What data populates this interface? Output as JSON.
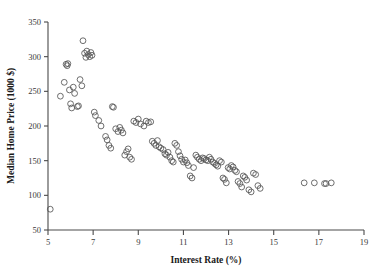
{
  "chart_data": {
    "type": "scatter",
    "title": "",
    "xlabel": "Interest Rate (%)",
    "ylabel": "Median Home Price (1000 $)",
    "xlim": [
      5,
      19
    ],
    "ylim": [
      50,
      350
    ],
    "xticks": [
      5,
      7,
      9,
      11,
      13,
      15,
      17,
      19
    ],
    "yticks": [
      50,
      100,
      150,
      200,
      250,
      300,
      350
    ],
    "xtick_labels": [
      "5",
      "7",
      "9",
      "11",
      "13",
      "15",
      "17",
      "19"
    ],
    "ytick_labels": [
      "50",
      "100",
      "150",
      "200",
      "250",
      "300",
      "350"
    ],
    "grid": false,
    "legend": false,
    "marker": "open-circle",
    "marker_color": "#555555",
    "points": [
      [
        5.1,
        80
      ],
      [
        5.55,
        243
      ],
      [
        5.72,
        263
      ],
      [
        5.8,
        289
      ],
      [
        5.85,
        287
      ],
      [
        5.88,
        290
      ],
      [
        5.95,
        252
      ],
      [
        6.0,
        232
      ],
      [
        6.05,
        226
      ],
      [
        6.12,
        256
      ],
      [
        6.18,
        247
      ],
      [
        6.3,
        228
      ],
      [
        6.35,
        229
      ],
      [
        6.42,
        267
      ],
      [
        6.5,
        258
      ],
      [
        6.55,
        323
      ],
      [
        6.62,
        305
      ],
      [
        6.68,
        299
      ],
      [
        6.72,
        308
      ],
      [
        6.78,
        303
      ],
      [
        6.85,
        300
      ],
      [
        6.9,
        306
      ],
      [
        6.95,
        302
      ],
      [
        7.05,
        220
      ],
      [
        7.1,
        215
      ],
      [
        7.25,
        208
      ],
      [
        7.35,
        200
      ],
      [
        7.55,
        185
      ],
      [
        7.62,
        180
      ],
      [
        7.7,
        172
      ],
      [
        7.78,
        168
      ],
      [
        7.85,
        228
      ],
      [
        7.9,
        227
      ],
      [
        8.0,
        196
      ],
      [
        8.1,
        192
      ],
      [
        8.18,
        198
      ],
      [
        8.25,
        194
      ],
      [
        8.32,
        190
      ],
      [
        8.4,
        158
      ],
      [
        8.48,
        163
      ],
      [
        8.55,
        167
      ],
      [
        8.62,
        155
      ],
      [
        8.7,
        152
      ],
      [
        8.8,
        207
      ],
      [
        8.9,
        205
      ],
      [
        9.0,
        210
      ],
      [
        9.1,
        203
      ],
      [
        9.25,
        200
      ],
      [
        9.35,
        207
      ],
      [
        9.45,
        205
      ],
      [
        9.55,
        206
      ],
      [
        9.62,
        178
      ],
      [
        9.7,
        175
      ],
      [
        9.78,
        172
      ],
      [
        9.85,
        179
      ],
      [
        9.92,
        170
      ],
      [
        10.0,
        168
      ],
      [
        10.1,
        166
      ],
      [
        10.18,
        160
      ],
      [
        10.25,
        158
      ],
      [
        10.32,
        162
      ],
      [
        10.4,
        155
      ],
      [
        10.48,
        150
      ],
      [
        10.55,
        148
      ],
      [
        10.62,
        175
      ],
      [
        10.7,
        172
      ],
      [
        10.78,
        163
      ],
      [
        10.85,
        157
      ],
      [
        10.92,
        152
      ],
      [
        11.0,
        148
      ],
      [
        11.08,
        151
      ],
      [
        11.15,
        147
      ],
      [
        11.22,
        143
      ],
      [
        11.3,
        128
      ],
      [
        11.38,
        125
      ],
      [
        11.45,
        140
      ],
      [
        11.55,
        158
      ],
      [
        11.62,
        155
      ],
      [
        11.7,
        152
      ],
      [
        11.78,
        150
      ],
      [
        11.85,
        154
      ],
      [
        11.92,
        153
      ],
      [
        12.0,
        151
      ],
      [
        12.08,
        150
      ],
      [
        12.15,
        155
      ],
      [
        12.22,
        152
      ],
      [
        12.3,
        148
      ],
      [
        12.38,
        146
      ],
      [
        12.45,
        144
      ],
      [
        12.52,
        142
      ],
      [
        12.6,
        150
      ],
      [
        12.68,
        148
      ],
      [
        12.75,
        125
      ],
      [
        12.82,
        123
      ],
      [
        12.9,
        118
      ],
      [
        12.98,
        140
      ],
      [
        13.05,
        138
      ],
      [
        13.12,
        143
      ],
      [
        13.2,
        141
      ],
      [
        13.28,
        136
      ],
      [
        13.35,
        134
      ],
      [
        13.42,
        120
      ],
      [
        13.5,
        117
      ],
      [
        13.58,
        112
      ],
      [
        13.65,
        128
      ],
      [
        13.72,
        126
      ],
      [
        13.8,
        122
      ],
      [
        13.9,
        108
      ],
      [
        14.0,
        105
      ],
      [
        14.1,
        132
      ],
      [
        14.2,
        130
      ],
      [
        14.3,
        114
      ],
      [
        14.4,
        110
      ],
      [
        16.35,
        118
      ],
      [
        16.8,
        118
      ],
      [
        17.25,
        117
      ],
      [
        17.32,
        117
      ],
      [
        17.55,
        118
      ]
    ]
  }
}
